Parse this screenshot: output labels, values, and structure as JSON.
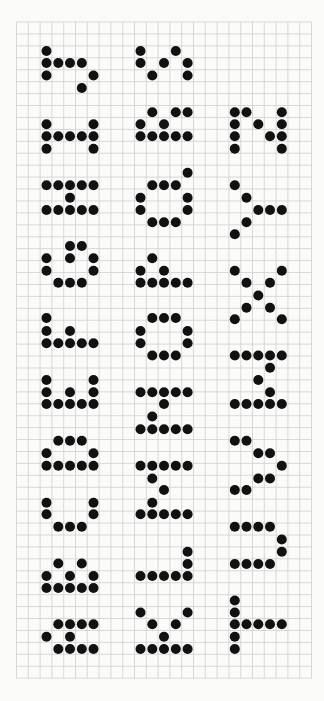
{
  "sheet": {
    "background": "#fbfbfa",
    "grid_color": "#cfcfcf",
    "dot_color": "#111111",
    "dot_radius": 5,
    "grid": {
      "left": 16.5,
      "top": 22,
      "right": 311.5,
      "bottom": 678.5,
      "col_pitch": 11.8,
      "row_pitch": 11.93
    }
  },
  "columns": {
    "g1": {
      "c2": 46.5,
      "c3": 58.3,
      "c4": 70.0,
      "c5": 81.8,
      "c6": 93.5
    },
    "g2": {
      "c10": 140.5,
      "c11": 152.3,
      "c12": 164.0,
      "c13": 175.8,
      "c14": 187.6
    },
    "g3": {
      "c18": 234.8,
      "c19": 246.5,
      "c20": 258.3,
      "c21": 270.0,
      "c22": 281.8
    }
  },
  "glyphs": [
    {
      "name": "glyph-col1-1",
      "rows": [
        [
          51,
          [
            46.5
          ]
        ],
        [
          63,
          [
            46.5,
            58.3,
            70.0,
            81.8
          ]
        ],
        [
          75.5,
          [
            46.5,
            93.5
          ]
        ],
        [
          88,
          [
            81.8
          ]
        ]
      ]
    },
    {
      "name": "glyph-col2-1",
      "rows": [
        [
          51,
          [
            140.5,
            175.8
          ]
        ],
        [
          63,
          [
            140.5,
            164.0,
            187.6
          ]
        ],
        [
          75.5,
          [
            152.3,
            187.6
          ]
        ]
      ]
    },
    {
      "name": "glyph-col1-2",
      "rows": [
        [
          124.3,
          [
            46.5,
            93.5
          ]
        ],
        [
          136.3,
          [
            46.5,
            58.3,
            70.0,
            81.8,
            93.5
          ]
        ],
        [
          148.7,
          [
            46.5,
            93.5
          ]
        ]
      ]
    },
    {
      "name": "glyph-col2-2",
      "rows": [
        [
          112.3,
          [
            152.3,
            175.8,
            187.6
          ]
        ],
        [
          124.3,
          [
            140.5,
            164.0
          ]
        ],
        [
          136.3,
          [
            140.5,
            152.3,
            164.0,
            175.8,
            187.6
          ]
        ]
      ]
    },
    {
      "name": "glyph-col3-1",
      "rows": [
        [
          112.3,
          [
            234.8,
            246.5,
            281.8
          ]
        ],
        [
          124.3,
          [
            234.8,
            258.3,
            281.8
          ]
        ],
        [
          136.3,
          [
            234.8,
            270.0,
            281.8
          ]
        ],
        [
          148.7,
          [
            234.8,
            281.8
          ]
        ]
      ]
    },
    {
      "name": "glyph-col1-3",
      "rows": [
        [
          185.3,
          [
            46.5,
            58.3,
            70.0,
            81.8,
            93.5
          ]
        ],
        [
          197.7,
          [
            70.0
          ]
        ],
        [
          210,
          [
            46.5,
            58.3,
            70.0,
            81.8,
            93.5
          ]
        ]
      ]
    },
    {
      "name": "glyph-col2-3",
      "rows": [
        [
          172.7,
          [
            187.6
          ]
        ],
        [
          185.3,
          [
            152.3,
            164.0,
            175.8
          ]
        ],
        [
          197.7,
          [
            140.5,
            187.6
          ]
        ],
        [
          210,
          [
            140.5,
            187.6
          ]
        ],
        [
          222.3,
          [
            152.3,
            164.0,
            175.8
          ]
        ]
      ]
    },
    {
      "name": "glyph-col3-2",
      "rows": [
        [
          185.3,
          [
            234.8
          ]
        ],
        [
          197.7,
          [
            246.5
          ]
        ],
        [
          210,
          [
            258.3,
            270.0,
            281.8
          ]
        ],
        [
          222.3,
          [
            246.5
          ]
        ],
        [
          234.3,
          [
            234.8
          ]
        ]
      ]
    },
    {
      "name": "glyph-col1-4",
      "rows": [
        [
          246,
          [
            70.0,
            81.8
          ]
        ],
        [
          258.3,
          [
            46.5,
            70.0,
            93.5
          ]
        ],
        [
          270.7,
          [
            46.5,
            93.5
          ]
        ],
        [
          282.7,
          [
            58.3,
            70.0,
            81.8
          ]
        ]
      ]
    },
    {
      "name": "glyph-col2-4",
      "rows": [
        [
          258.3,
          [
            152.3
          ]
        ],
        [
          270.7,
          [
            140.5,
            164.0
          ]
        ],
        [
          282.7,
          [
            140.5,
            152.3,
            164.0,
            175.8,
            187.6
          ]
        ]
      ]
    },
    {
      "name": "glyph-col3-3",
      "rows": [
        [
          270.7,
          [
            234.8,
            281.8
          ]
        ],
        [
          282.7,
          [
            246.5,
            270.0
          ]
        ],
        [
          295.5,
          [
            258.3
          ]
        ],
        [
          307.7,
          [
            246.5,
            270.0
          ]
        ],
        [
          319.3,
          [
            234.8,
            281.8
          ]
        ]
      ]
    },
    {
      "name": "glyph-col1-5",
      "rows": [
        [
          318,
          [
            46.5
          ]
        ],
        [
          331,
          [
            46.5,
            70.0
          ]
        ],
        [
          343.3,
          [
            46.5,
            58.3,
            70.0,
            81.8,
            93.5
          ]
        ]
      ]
    },
    {
      "name": "glyph-col2-5",
      "rows": [
        [
          318,
          [
            152.3,
            164.0,
            175.8
          ]
        ],
        [
          331,
          [
            140.5,
            187.6
          ]
        ],
        [
          343.3,
          [
            140.5,
            187.6
          ]
        ],
        [
          355.5,
          [
            152.3,
            164.0,
            175.8
          ]
        ]
      ]
    },
    {
      "name": "glyph-col3-4",
      "rows": [
        [
          355.5,
          [
            234.8,
            246.5,
            258.3,
            270.0,
            281.8
          ]
        ],
        [
          367.8,
          [
            270.0
          ]
        ],
        [
          380,
          [
            258.3
          ]
        ],
        [
          392.2,
          [
            270.0
          ]
        ],
        [
          404,
          [
            234.8,
            246.5,
            258.3,
            270.0,
            281.8
          ]
        ]
      ]
    },
    {
      "name": "glyph-col1-6",
      "rows": [
        [
          380,
          [
            46.5,
            93.5
          ]
        ],
        [
          392.2,
          [
            46.5,
            70.0,
            93.5
          ]
        ],
        [
          404,
          [
            46.5,
            58.3,
            70.0,
            81.8,
            93.5
          ]
        ]
      ]
    },
    {
      "name": "glyph-col2-6",
      "rows": [
        [
          392.2,
          [
            140.5,
            152.3,
            164.0,
            175.8,
            187.6
          ]
        ],
        [
          404,
          [
            164.0
          ]
        ],
        [
          416.5,
          [
            152.3
          ]
        ],
        [
          429.3,
          [
            140.5,
            152.3,
            164.0,
            175.8,
            187.6
          ]
        ]
      ]
    },
    {
      "name": "glyph-col1-7",
      "rows": [
        [
          440.7,
          [
            58.3,
            70.0,
            81.8
          ]
        ],
        [
          453.3,
          [
            46.5,
            93.5
          ]
        ],
        [
          465.7,
          [
            46.5,
            58.3,
            70.0,
            81.8,
            93.5
          ]
        ]
      ]
    },
    {
      "name": "glyph-col2-7",
      "rows": [
        [
          465.7,
          [
            140.5,
            152.3,
            164.0,
            175.8,
            187.6
          ]
        ],
        [
          478.5,
          [
            152.3
          ]
        ],
        [
          490,
          [
            164.0
          ]
        ],
        [
          502.7,
          [
            152.3
          ]
        ],
        [
          514.3,
          [
            140.5,
            152.3,
            164.0,
            175.8,
            187.6
          ]
        ]
      ]
    },
    {
      "name": "glyph-col3-5",
      "rows": [
        [
          440.7,
          [
            234.8,
            246.5
          ]
        ],
        [
          453.3,
          [
            258.3,
            270.0
          ]
        ],
        [
          465.7,
          [
            281.8
          ]
        ],
        [
          478.5,
          [
            258.3,
            270.0
          ]
        ],
        [
          490,
          [
            234.8,
            246.5
          ]
        ]
      ]
    },
    {
      "name": "glyph-col1-8",
      "rows": [
        [
          502.7,
          [
            46.5,
            93.5
          ]
        ],
        [
          514.3,
          [
            46.5,
            93.5
          ]
        ],
        [
          526.7,
          [
            58.3,
            70.0,
            81.8
          ]
        ]
      ]
    },
    {
      "name": "glyph-col3-6",
      "rows": [
        [
          526.7,
          [
            234.8,
            246.5,
            258.3,
            270.0
          ]
        ],
        [
          539.5,
          [
            281.8
          ]
        ],
        [
          551.7,
          [
            281.8
          ]
        ],
        [
          564,
          [
            234.8,
            246.5,
            258.3,
            270.0
          ]
        ]
      ]
    },
    {
      "name": "glyph-col1-9",
      "rows": [
        [
          563.5,
          [
            58.3,
            81.8
          ]
        ],
        [
          576,
          [
            46.5,
            70.0,
            93.5
          ]
        ],
        [
          588,
          [
            46.5,
            58.3,
            70.0,
            81.8,
            93.5
          ]
        ]
      ]
    },
    {
      "name": "glyph-col2-8",
      "rows": [
        [
          551.7,
          [
            187.6
          ]
        ],
        [
          564,
          [
            187.6
          ]
        ],
        [
          576,
          [
            140.5,
            152.3,
            164.0,
            175.8,
            187.6
          ]
        ]
      ]
    },
    {
      "name": "glyph-col1-10",
      "rows": [
        [
          624.3,
          [
            58.3,
            70.0,
            81.8,
            93.5
          ]
        ],
        [
          636.7,
          [
            46.5,
            70.0
          ]
        ],
        [
          649,
          [
            58.3,
            70.0,
            81.8,
            93.5
          ]
        ]
      ]
    },
    {
      "name": "glyph-col2-9",
      "rows": [
        [
          612.5,
          [
            140.5,
            187.6
          ]
        ],
        [
          624.3,
          [
            152.3,
            175.8
          ]
        ],
        [
          636.7,
          [
            164.0
          ]
        ],
        [
          649,
          [
            140.5,
            152.3,
            164.0,
            175.8,
            187.6
          ]
        ]
      ]
    },
    {
      "name": "glyph-col3-7",
      "rows": [
        [
          600.5,
          [
            234.8
          ]
        ],
        [
          612.5,
          [
            234.8
          ]
        ],
        [
          624.3,
          [
            234.8,
            246.5,
            258.3,
            270.0,
            281.8
          ]
        ],
        [
          636.7,
          [
            234.8
          ]
        ],
        [
          649,
          [
            234.8
          ]
        ]
      ]
    }
  ]
}
